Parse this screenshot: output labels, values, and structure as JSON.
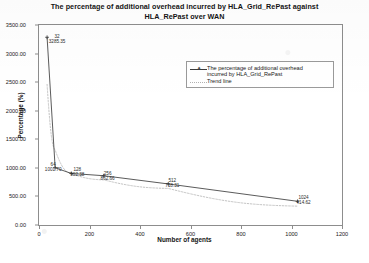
{
  "chart_data": {
    "type": "line",
    "title": "The percentage of additional overhead incurred by HLA_Grid_RePast  against HLA_RePast over WAN",
    "title_line1": "The percentage of additional overhead incurred by HLA_Grid_RePast  against",
    "title_line2": "HLA_RePast over WAN",
    "xlabel": "Number of agents",
    "ylabel": "Percentage (%)",
    "xlim": [
      0,
      1200
    ],
    "ylim": [
      0,
      3500
    ],
    "xticks": [
      "0",
      "200",
      "400",
      "600",
      "800",
      "1000",
      "1200"
    ],
    "xtick_values": [
      0,
      200,
      400,
      600,
      800,
      1000,
      1200
    ],
    "yticks": [
      "0.00",
      "500.00",
      "1000.00",
      "1500.00",
      "2000.00",
      "2500.00",
      "3000.00",
      "3500.00"
    ],
    "ytick_values": [
      0,
      500,
      1000,
      1500,
      2000,
      2500,
      3000,
      3500
    ],
    "grid": false,
    "legend_position": "upper-right-inside",
    "series": [
      {
        "name": "The percentage of additional overhead\nincurred by HLA_Grid_RePast",
        "style": "solid-with-markers",
        "color": "#3b3b3b",
        "x": [
          32,
          64,
          128,
          256,
          512,
          1024
        ],
        "values": [
          3285.35,
          1001.7,
          902.38,
          862.66,
          718.31,
          414.62
        ]
      },
      {
        "name": "Trend line",
        "style": "dotted",
        "color": "#b8b8b8",
        "x": [
          32,
          64,
          128,
          256,
          512,
          1024
        ],
        "values": [
          2460.0,
          1310.0,
          900.0,
          790.0,
          640.0,
          330.0
        ]
      }
    ],
    "point_labels": [
      {
        "x_label": "32",
        "y_label": "3285.35",
        "x": 32,
        "y": 3285.35
      },
      {
        "x_label": "64",
        "y_label": "1001.70",
        "x": 64,
        "y": 1001.7
      },
      {
        "x_label": "128",
        "y_label": "902.38",
        "x": 128,
        "y": 902.38
      },
      {
        "x_label": "256",
        "y_label": "862.66",
        "x": 256,
        "y": 862.66
      },
      {
        "x_label": "512",
        "y_label": "718.31",
        "x": 512,
        "y": 718.31
      },
      {
        "x_label": "1024",
        "y_label": "414.62",
        "x": 1024,
        "y": 414.62
      }
    ]
  },
  "legend": {
    "entries": [
      {
        "label": "The percentage of additional overhead\nincurred by HLA_Grid_RePast"
      },
      {
        "label": "Trend line"
      }
    ]
  }
}
